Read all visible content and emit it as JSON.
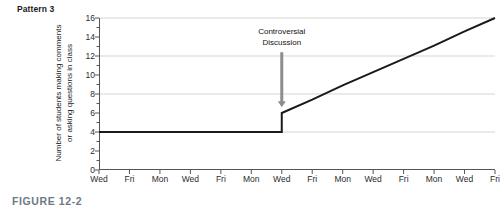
{
  "figure": {
    "pattern_title": "Pattern 3",
    "caption": "FIGURE 12-2",
    "caption_color": "#6b7a86"
  },
  "chart_data": {
    "type": "line",
    "title": "Pattern 3",
    "xlabel": "",
    "ylabel": "Number of students making comments or asking questions in class",
    "ylabel_lines": [
      "Number of students making comments",
      "or asking questions in class"
    ],
    "categories": [
      "Wed",
      "Fri",
      "Mon",
      "Wed",
      "Fri",
      "Mon",
      "Wed",
      "Fri",
      "Mon",
      "Wed",
      "Fri",
      "Mon",
      "Wed",
      "Fri"
    ],
    "x": [
      0,
      1,
      2,
      3,
      4,
      5,
      6,
      7,
      8,
      9,
      10,
      11,
      12,
      13
    ],
    "values": [
      4,
      4,
      4,
      4,
      4,
      4,
      6,
      7.4,
      8.9,
      10.3,
      11.7,
      13.1,
      14.6,
      16
    ],
    "series": [
      {
        "name": "Students participating",
        "values": [
          4,
          4,
          4,
          4,
          4,
          4,
          6,
          7.4,
          8.9,
          10.3,
          11.7,
          13.1,
          14.6,
          16
        ],
        "color": "#1a1a1a",
        "jump_at_index": 6,
        "jump_from": 4,
        "jump_to": 6
      }
    ],
    "ylim": [
      0,
      16
    ],
    "xlim": [
      0,
      13
    ],
    "yticks": [
      16,
      14,
      12,
      10,
      8,
      6,
      4,
      2,
      0
    ],
    "gridlines_y": [
      16,
      12,
      8,
      4
    ],
    "grid": true,
    "legend": "none",
    "line_color": "#1a1a1a",
    "grid_color": "#d5d5d5",
    "axis_color": "#555555",
    "annotations": [
      {
        "label_lines": [
          "Controversial",
          "Discussion"
        ],
        "text": "Controversial Discussion",
        "at_category": "Wed",
        "at_x_index": 6,
        "arrow": "down-arrow-icon",
        "arrow_from_y": 12.4,
        "arrow_to_y": 6.6
      }
    ]
  }
}
